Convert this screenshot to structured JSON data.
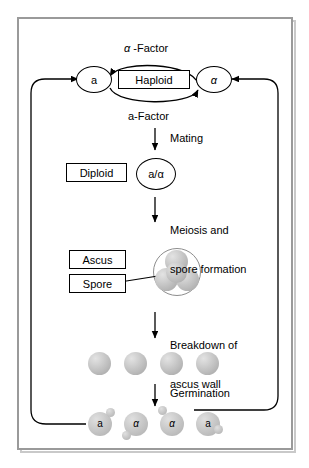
{
  "diagram": {
    "frame_color": "#9a9a9a",
    "sphere_color": "#c2c2c2",
    "line_color": "#000000"
  },
  "nodes": {
    "a_haploid": "a",
    "alpha_haploid": "α",
    "haploid_box": "Haploid",
    "diploid_box": "Diploid",
    "diploid_cell": "a/α",
    "ascus_box": "Ascus",
    "spore_box": "Spore"
  },
  "labels": {
    "alpha_factor": "α -Factor",
    "a_factor": "a-Factor",
    "mating": "Mating",
    "meiosis_line1": "Meiosis and",
    "meiosis_line2": "spore formation",
    "breakdown_line1": "Breakdown of",
    "breakdown_line2": "ascus wall",
    "germination": "Germination"
  },
  "spores": [
    {
      "id": "spore-1"
    },
    {
      "id": "spore-2"
    },
    {
      "id": "spore-3"
    },
    {
      "id": "spore-4"
    }
  ],
  "germinated_cells": [
    {
      "label": "a"
    },
    {
      "label": "α"
    },
    {
      "label": "α"
    },
    {
      "label": "a"
    }
  ],
  "ascus_spores": [
    {
      "id": "tetrad-top"
    },
    {
      "id": "tetrad-left"
    },
    {
      "id": "tetrad-right"
    },
    {
      "id": "tetrad-center"
    }
  ]
}
